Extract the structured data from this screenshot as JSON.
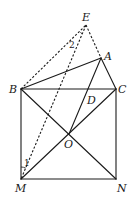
{
  "diagram": {
    "points": {
      "E": {
        "label": "E",
        "x": 86,
        "y": 25
      },
      "A": {
        "label": "A",
        "x": 101,
        "y": 58
      },
      "B": {
        "label": "B",
        "x": 21,
        "y": 89
      },
      "C": {
        "label": "C",
        "x": 116,
        "y": 89
      },
      "D": {
        "label": "D",
        "x": 89,
        "y": 89
      },
      "O": {
        "label": "O",
        "x": 69,
        "y": 134
      },
      "M": {
        "label": "M",
        "x": 21,
        "y": 179
      },
      "N": {
        "label": "N",
        "x": 116,
        "y": 179
      }
    },
    "solid_segments": [
      "BC",
      "CN",
      "NM",
      "MB",
      "BN",
      "MC",
      "BA",
      "AC",
      "AO"
    ],
    "dashed_segments": [
      "BE",
      "EA",
      "EM"
    ],
    "angle_marks": [
      {
        "label": "1",
        "vertex": "M"
      },
      {
        "label": "2",
        "vertex": "E"
      }
    ],
    "colors": {
      "stroke": "#1a1a1a",
      "background": "#ffffff"
    }
  }
}
